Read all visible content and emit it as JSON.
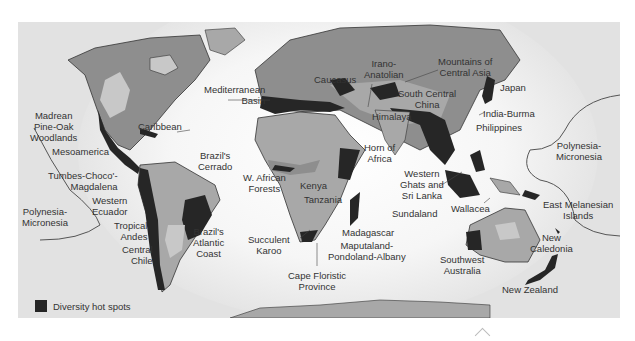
{
  "figure": {
    "type": "world-map",
    "legend": {
      "swatch_color": "#262626",
      "label": "Diversity hot spots"
    },
    "colors": {
      "ocean": "#e2e2e2",
      "land_dark": "#8e8e8e",
      "land_mid": "#a8a8a8",
      "land_light": "#c8c8c8",
      "hotspot": "#262626",
      "label_text": "#333333"
    }
  },
  "labels": {
    "madrean": "Madrean\nPine-Oak\nWoodlands",
    "caribbean": "Caribbean",
    "mesoamerica": "Mesoamerica",
    "tumbes": "Tumbes-Choco'-\nMagdalena",
    "western_ecuador": "Western\nEcuador",
    "polynesia_west": "Polynesia-\nMicronesia",
    "tropical_andes": "Tropical\nAndes",
    "central_chile": "Central\nChile",
    "brazil_cerrado": "Brazil's\nCerrado",
    "brazil_atlantic": "Brazil's\nAtlantic\nCoast",
    "mediterranean": "Mediterranean\nBasin",
    "caucasus": "Caucasus",
    "irano_anatolian": "Irano-\nAnatolian",
    "mountains_central_asia": "Mountains of\nCentral Asia",
    "south_central_china": "South Central\nChina",
    "himalaya": "Himalaya",
    "japan": "Japan",
    "india_burma": "India-Burma",
    "philippines": "Philippines",
    "polynesia_east": "Polynesia-\nMicronesia",
    "horn_of_africa": "Horn of\nAfrica",
    "w_african_forests": "W. African\nForests",
    "kenya": "Kenya",
    "tanzania": "Tanzania",
    "western_ghats": "Western\nGhats and\nSri Lanka",
    "sundaland": "Sundaland",
    "wallacea": "Wallacea",
    "east_melanesian": "East Melanesian\nIslands",
    "madagascar": "Madagascar",
    "maputaland": "Maputaland-\nPondoland-Albany",
    "succulent_karoo": "Succulent\nKaroo",
    "cape_floristic": "Cape Floristic\nProvince",
    "southwest_australia": "Southwest\nAustralia",
    "new_caledonia": "New\nCaledonia",
    "new_zealand": "New Zealand"
  }
}
